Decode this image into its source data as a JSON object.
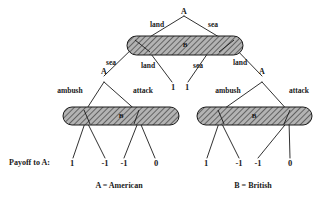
{
  "diagram": {
    "type": "extensive-form-game-tree",
    "title": "",
    "background_color": "#ffffff",
    "line_color": "#1a1a1a",
    "oval_fill": "#9a9a9a",
    "oval_stroke": "#1a1a1a"
  },
  "nodes": {
    "root": {
      "label": "A",
      "player": "A",
      "x": 184,
      "y": 12
    },
    "left_decision": {
      "label": "A",
      "player": "A",
      "x": 104,
      "y": 79
    },
    "right_decision": {
      "label": "A",
      "player": "A",
      "x": 262,
      "y": 79
    },
    "top_info_set": {
      "label": "B",
      "player": "B",
      "x": 185,
      "y": 45
    },
    "left_info_set": {
      "label": "B",
      "player": "B",
      "x": 121,
      "y": 116
    },
    "right_info_set": {
      "label": "B",
      "player": "B",
      "x": 254,
      "y": 116
    }
  },
  "branch_labels": {
    "root_left": "land",
    "root_right": "sea",
    "info_left_outer": "sea",
    "info_left_inner": "land",
    "info_right_inner": "sea",
    "info_right_outer": "land",
    "left_ambush": "ambush",
    "left_attack": "attack",
    "right_ambush": "ambush",
    "right_attack": "attack"
  },
  "payoffs": {
    "title": "Payoff to A:",
    "left_group": [
      "1",
      "-1",
      "-1",
      "0"
    ],
    "middle_group": [
      "1",
      "1"
    ],
    "right_group": [
      "1",
      "-1",
      "-1",
      "0"
    ]
  },
  "legend": {
    "a": "A = American",
    "b": "B = British"
  }
}
